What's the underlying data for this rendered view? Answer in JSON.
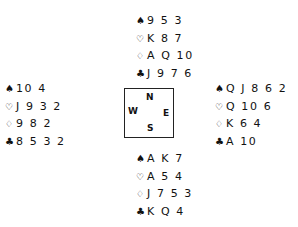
{
  "diagram": {
    "type": "bridge-deal",
    "suit_icons": {
      "spades": "♠",
      "hearts": "♡",
      "diamonds": "♢",
      "clubs": "♣"
    },
    "compass": {
      "north": "N",
      "south": "S",
      "west": "W",
      "east": "E"
    },
    "hands": {
      "north": {
        "spades": "9 5 3",
        "hearts": "K 8 7",
        "diamonds": "A Q 10",
        "clubs": "J 9 7 6"
      },
      "west": {
        "spades": "10 4",
        "hearts": "J 9 3 2",
        "diamonds": "9 8 2",
        "clubs": "8 5 3 2"
      },
      "east": {
        "spades": "Q J 8 6 2",
        "hearts": "Q 10 6",
        "diamonds": "K 6 4",
        "clubs": "A 10"
      },
      "south": {
        "spades": "A K 7",
        "hearts": "A 5 4",
        "diamonds": "J 7 5 3",
        "clubs": "K Q 4"
      }
    }
  }
}
